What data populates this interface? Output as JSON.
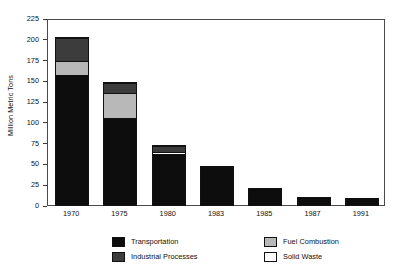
{
  "chart_data": {
    "type": "bar",
    "stacked": true,
    "title": "",
    "subtitle": "",
    "xlabel": "",
    "ylabel": "Million Metric Tons",
    "ylim": [
      0,
      225
    ],
    "ytick_values": [
      0,
      25,
      50,
      75,
      100,
      125,
      150,
      175,
      200,
      225
    ],
    "ytick_labels": [
      "0",
      "25",
      "50",
      "75",
      "100",
      "125",
      "150",
      "175",
      "200",
      "225"
    ],
    "grid": false,
    "legend_position": "bottom",
    "categories": [
      "1970",
      "1975",
      "1980",
      "1983",
      "1985",
      "1987",
      "1991"
    ],
    "series": [
      {
        "name": "Transportation",
        "color": "#0d0d0d",
        "values": [
          156,
          105,
          61,
          46,
          19,
          8,
          7
        ]
      },
      {
        "name": "Fuel Combustion",
        "color": "#b8b8b8",
        "values": [
          16,
          28,
          0,
          0,
          0,
          0,
          0
        ]
      },
      {
        "name": "Solid Waste",
        "color": "#ffffff",
        "values": [
          0,
          0,
          1,
          0,
          0,
          0,
          0
        ]
      },
      {
        "name": "Industrial Processes",
        "color": "#3c3c3c",
        "values": [
          27,
          12,
          7,
          0,
          0,
          0,
          0
        ]
      }
    ],
    "totals": [
      199,
      145,
      69,
      46,
      19,
      8,
      7
    ],
    "annotations": []
  },
  "legend": {
    "entries": [
      {
        "label": "Transportation",
        "swatch": "transportation",
        "col": 0,
        "row": 0
      },
      {
        "label": "Fuel Combustion",
        "swatch": "fuel",
        "col": 1,
        "row": 0
      },
      {
        "label": "Industrial Processes",
        "swatch": "industrial",
        "col": 0,
        "row": 1
      },
      {
        "label": "Solid Waste",
        "swatch": "solid",
        "col": 1,
        "row": 1
      }
    ]
  }
}
